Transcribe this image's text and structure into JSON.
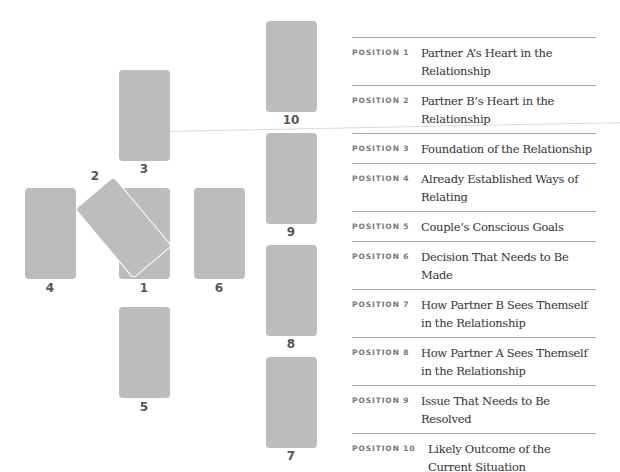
{
  "spread": {
    "cards": [
      {
        "number": "1",
        "left": 119,
        "top": 188
      },
      {
        "number": "2",
        "rotated": true
      },
      {
        "number": "3",
        "left": 119,
        "top": 70
      },
      {
        "number": "4",
        "left": 25,
        "top": 188
      },
      {
        "number": "5",
        "left": 119,
        "top": 307
      },
      {
        "number": "6",
        "left": 194,
        "top": 188
      },
      {
        "number": "7",
        "left": 266,
        "top": 357
      },
      {
        "number": "8",
        "left": 266,
        "top": 245
      },
      {
        "number": "9",
        "left": 266,
        "top": 133
      },
      {
        "number": "10",
        "left": 266,
        "top": 21
      }
    ],
    "card_color": "#bcbcbc"
  },
  "legend": {
    "rows": [
      {
        "label": "POSITION 1",
        "text": "Partner A’s Heart in the Relationship"
      },
      {
        "label": "POSITION 2",
        "text": "Partner B’s Heart in the Relationship"
      },
      {
        "label": "POSITION 3",
        "text": "Foundation of the Relationship"
      },
      {
        "label": "POSITION 4",
        "text": "Already Established Ways of Relating"
      },
      {
        "label": "POSITION 5",
        "text": "Couple’s Conscious Goals"
      },
      {
        "label": "POSITION 6",
        "text": "Decision That Needs to Be Made"
      },
      {
        "label": "POSITION 7",
        "text": "How Partner B Sees Themself in the Relationship"
      },
      {
        "label": "POSITION 8",
        "text": "How Partner A Sees Themself in the Relationship"
      },
      {
        "label": "POSITION 9",
        "text": "Issue That Needs to Be Resolved"
      },
      {
        "label": "POSITION 10",
        "text": "Likely Outcome of the Current Situation"
      }
    ]
  }
}
